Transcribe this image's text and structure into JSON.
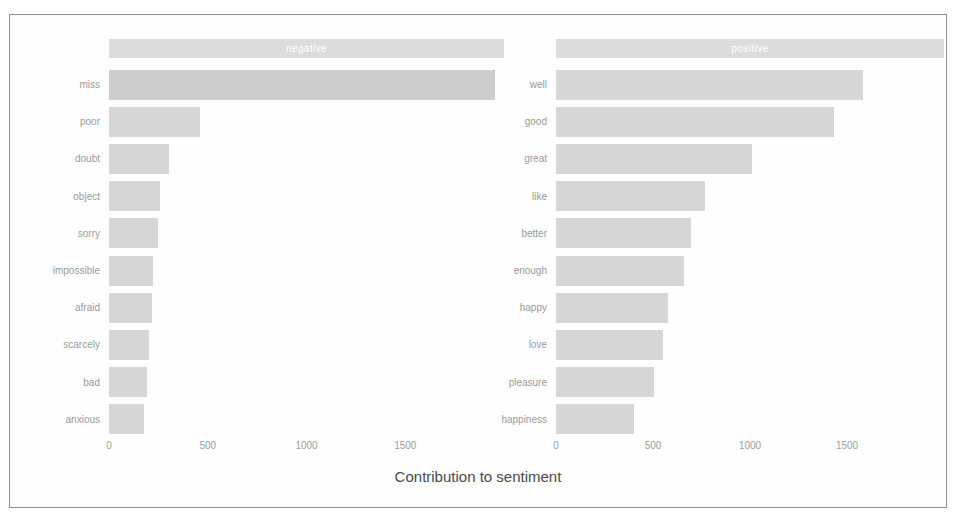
{
  "figure": {
    "x_axis_title": "Contribution to sentiment",
    "colors": {
      "bar": "#d6d6d6",
      "strip": "#dcdcdc",
      "strip_text": "#ffffff",
      "label_text": "#9a9a9a",
      "frame": "#8e9196",
      "background": "#ffffff"
    }
  },
  "chart_data": {
    "type": "bar",
    "orientation": "horizontal",
    "title": "",
    "xlabel": "Contribution to sentiment",
    "ylabel": "",
    "xlim": [
      0,
      2000
    ],
    "ticks": [
      0,
      500,
      1000,
      1500
    ],
    "tick_labels": [
      "0",
      "500",
      "1000",
      "1500"
    ],
    "grid": false,
    "legend": "none",
    "facets": [
      {
        "name": "negative",
        "strip_label": "negative",
        "categories": [
          "miss",
          "poor",
          "doubt",
          "object",
          "sorry",
          "impossible",
          "afraid",
          "scarcely",
          "bad",
          "anxious"
        ],
        "values": [
          1955,
          460,
          305,
          259,
          247,
          225,
          219,
          202,
          190,
          178
        ]
      },
      {
        "name": "positive",
        "strip_label": "positive",
        "categories": [
          "well",
          "good",
          "great",
          "like",
          "better",
          "enough",
          "happy",
          "love",
          "pleasure",
          "happiness"
        ],
        "values": [
          1583,
          1433,
          1011,
          767,
          695,
          661,
          578,
          550,
          505,
          400
        ]
      }
    ]
  }
}
